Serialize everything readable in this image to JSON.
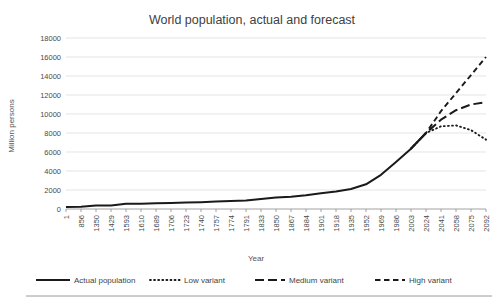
{
  "chart_data": {
    "type": "line",
    "title": "World population, actual and forecast",
    "xlabel": "Year",
    "ylabel": "Million persons",
    "ylim": [
      0,
      18000
    ],
    "ytick_step": 2000,
    "yticks": [
      0,
      2000,
      4000,
      6000,
      8000,
      10000,
      12000,
      14000,
      16000,
      18000
    ],
    "grid": true,
    "legend_position": "bottom",
    "categories": [
      "1",
      "856",
      "1350",
      "1429",
      "1593",
      "1610",
      "1689",
      "1706",
      "1723",
      "1740",
      "1757",
      "1774",
      "1791",
      "1833",
      "1850",
      "1867",
      "1884",
      "1901",
      "1918",
      "1935",
      "1952",
      "1969",
      "1986",
      "2003",
      "2024",
      "2041",
      "2058",
      "2075",
      "2092"
    ],
    "series": [
      {
        "name": "Actual population",
        "style": "solid",
        "color": "#1a1a1a",
        "values": [
          200,
          240,
          370,
          375,
          545,
          560,
          600,
          640,
          680,
          720,
          780,
          830,
          900,
          1050,
          1200,
          1300,
          1450,
          1650,
          1850,
          2100,
          2600,
          3600,
          4950,
          6350,
          8000,
          null,
          null,
          null,
          null
        ]
      },
      {
        "name": "Low variant",
        "style": "dotted",
        "color": "#1a1a1a",
        "values": [
          null,
          null,
          null,
          null,
          null,
          null,
          null,
          null,
          null,
          null,
          null,
          null,
          null,
          null,
          null,
          null,
          null,
          null,
          null,
          null,
          null,
          null,
          null,
          6350,
          8000,
          8700,
          8800,
          8300,
          7300
        ]
      },
      {
        "name": "Medium variant",
        "style": "long-dash",
        "color": "#1a1a1a",
        "values": [
          null,
          null,
          null,
          null,
          null,
          null,
          null,
          null,
          null,
          null,
          null,
          null,
          null,
          null,
          null,
          null,
          null,
          null,
          null,
          null,
          null,
          null,
          null,
          6350,
          8000,
          9400,
          10400,
          11000,
          11250
        ]
      },
      {
        "name": "High variant",
        "style": "dash",
        "color": "#1a1a1a",
        "values": [
          null,
          null,
          null,
          null,
          null,
          null,
          null,
          null,
          null,
          null,
          null,
          null,
          null,
          null,
          null,
          null,
          null,
          null,
          null,
          null,
          null,
          null,
          null,
          6350,
          8000,
          10300,
          12200,
          14100,
          16000
        ]
      }
    ]
  },
  "legend": {
    "items": [
      {
        "label": "Actual population",
        "style": "solid"
      },
      {
        "label": "Low variant",
        "style": "dotted"
      },
      {
        "label": "Medium variant",
        "style": "long-dash"
      },
      {
        "label": "High variant",
        "style": "dash"
      }
    ]
  },
  "colors": {
    "series": "#1a1a1a",
    "grid": "#d9d9d9",
    "axis": "#8a8a8a",
    "text": "#404040"
  }
}
